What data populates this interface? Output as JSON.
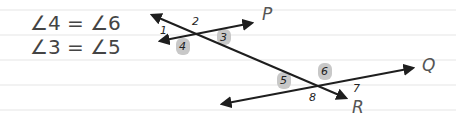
{
  "equations": [
    {
      "text": "∠4 = ∠6"
    },
    {
      "text": "∠3 = ∠5"
    }
  ],
  "lines": {
    "P": {
      "label": "P"
    },
    "Q": {
      "label": "Q"
    },
    "R": {
      "label": "R"
    }
  },
  "angles": [
    {
      "n": "1",
      "highlighted": false
    },
    {
      "n": "2",
      "highlighted": false
    },
    {
      "n": "3",
      "highlighted": true
    },
    {
      "n": "4",
      "highlighted": true
    },
    {
      "n": "5",
      "highlighted": true
    },
    {
      "n": "6",
      "highlighted": true
    },
    {
      "n": "7",
      "highlighted": false
    },
    {
      "n": "8",
      "highlighted": false
    }
  ],
  "colors": {
    "ruled_line": "#e6e6e6",
    "ink": "#1e1e1e",
    "highlight": "#c8c8c8"
  }
}
